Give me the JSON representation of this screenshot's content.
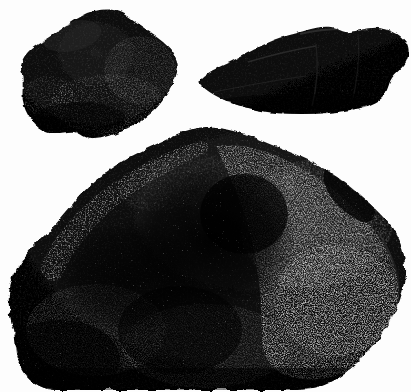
{
  "image": {
    "kind": "photograph",
    "subject": "three dark mineral specimens (coal / meteorite fragments)",
    "background_color": "#fdfdfd",
    "specimen_base_color": "#080808",
    "specimen_shadow_color": "#000000",
    "speckle_color": "#d8d8d8",
    "highlight_color": "#f2f2f2",
    "midtone_color": "#2a2a2a",
    "width": 411,
    "height": 392,
    "alt_text": "Three irregular black rock specimens photographed on a white background: a rounded lump at upper left, an elongated wedge at upper right, and a large dome-shaped mass filling the lower two thirds."
  },
  "specimens": [
    {
      "id": "specimen-upper-left",
      "label": "Upper left specimen",
      "shape": "rounded angular lump",
      "outline": "M 22,74 C 18,62 26,50 42,42 C 58,33 72,20 88,13 C 104,7 118,9 128,17 C 140,26 152,33 163,42 C 174,51 180,62 177,72 C 174,84 168,94 160,104 C 152,114 140,122 128,128 C 116,134 104,139 92,139 C 84,139 80,133 74,132 C 64,131 56,136 46,132 C 36,128 28,118 24,106 C 21,96 24,84 22,74 Z",
      "bbox": [
        6,
        8,
        178,
        141
      ],
      "texture": "granular with sparse bright speckles along lower and right margins"
    },
    {
      "id": "specimen-upper-right",
      "label": "Upper right specimen",
      "shape": "elongated wedge / slab",
      "outline": "M 201,79 C 210,70 222,66 234,60 C 248,53 260,46 272,41 C 284,36 294,34 304,31 C 314,28 322,26 331,27 C 338,28 342,33 350,32 C 360,31 368,27 378,28 C 390,29 400,34 406,42 C 410,48 409,56 406,62 C 402,69 396,72 392,78 C 388,84 388,92 382,98 C 374,105 362,108 350,110 C 334,113 318,114 302,114 C 286,114 270,113 256,110 C 242,107 230,103 220,98 C 212,94 206,90 202,86 C 199,83 199,81 201,79 Z",
      "bbox": [
        199,
        26,
        410,
        115
      ],
      "texture": "smooth cleaved faces with a bumpy ridged upper edge"
    },
    {
      "id": "specimen-main-large",
      "label": "Large lower specimen",
      "shape": "massive irregular dome",
      "outline": "M 14,330 C 8,312 6,292 14,274 C 22,256 36,244 48,232 C 58,222 66,212 76,200 C 88,186 102,174 118,164 C 134,154 152,146 170,138 C 186,131 200,127 216,128 C 232,129 246,134 260,140 C 276,147 292,152 308,160 C 324,168 340,178 354,190 C 368,202 382,214 392,228 C 402,242 406,258 405,274 C 404,292 398,308 390,322 C 382,336 372,348 362,358 C 352,368 342,376 330,382 C 318,388 306,390 292,390 C 270,390 248,390 226,390 C 196,390 166,390 136,390 C 110,390 84,390 58,390 C 44,390 32,384 24,372 C 16,360 16,346 14,330 Z",
      "bbox": [
        6,
        126,
        406,
        392
      ],
      "texture": "heavily vesicular; bright crystalline speckle band along the upper-left rim and across the whole right flank; deep dark cavity near the centre"
    }
  ],
  "regions": {
    "speckle_band_left": "bright granular rim following the upper-left contour of the large specimen",
    "speckle_field_right": "dense bright speckle field covering the right half of the large specimen",
    "central_cavity": "deep black shadowed hollow at the centre of the large specimen",
    "bottom_crop": "the base of the large specimen is cropped by the lower edge of the plate"
  }
}
